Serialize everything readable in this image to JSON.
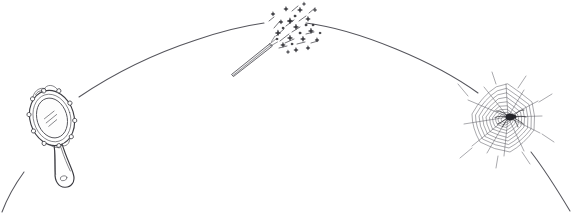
{
  "scene": {
    "title": "Hand-drawn arc with mirror, magic wand and spider web",
    "width": 573,
    "height": 213,
    "background_color": "#ffffff",
    "ink_color": "#3a3a3f",
    "arc_color": "#55555c",
    "style": "pen-and-ink line drawing, no text labels"
  },
  "arc": {
    "name": "curved-path",
    "description": "Single large circular arc spanning the image, peaking near the top center",
    "left_endpoint": [
      0,
      213
    ],
    "apex": [
      286,
      22
    ],
    "right_endpoint": [
      573,
      213
    ],
    "notes": "Arc is interrupted where the wand sparkles overlap it near the apex"
  },
  "objects": [
    {
      "id": "hand-mirror",
      "label": "hand mirror",
      "position": [
        52,
        122
      ],
      "rotation_deg": -18,
      "parts": [
        "oval frame",
        "oval glass",
        "highlight lines",
        "decorative studs",
        "tapered handle",
        "bulbous handle end"
      ],
      "stud_count": 8,
      "highlight_line_count": 3
    },
    {
      "id": "magic-wand",
      "label": "magic wand with sparkles",
      "position": [
        286,
        40
      ],
      "rotation_deg": -36,
      "parts": [
        "tapered stick",
        "star burst",
        "sparkle dashes"
      ],
      "star_count": 26,
      "dash_count": 14
    },
    {
      "id": "spider-web",
      "label": "spider web with spider",
      "position": [
        502,
        120
      ],
      "parts": [
        "radial spokes",
        "concentric spiral rings",
        "anchor threads",
        "spider"
      ],
      "spoke_count": 12,
      "ring_count": 11,
      "spider_position": [
        508,
        117
      ]
    }
  ],
  "colors": {
    "background": "#ffffff",
    "ink": "#3a3a3f",
    "arc": "#55555c",
    "web": "#53535a",
    "sparkle": "#2e2e33",
    "spider": "#26262b"
  }
}
